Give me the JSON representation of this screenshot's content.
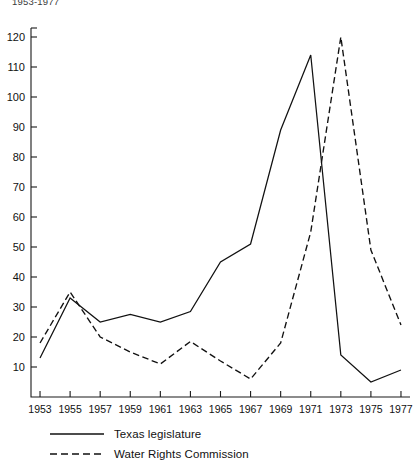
{
  "figure": {
    "top_note": "1953-1977"
  },
  "chart_data": {
    "type": "line",
    "title": "",
    "subtitle": "",
    "xlabel": "",
    "ylabel": "",
    "x": [
      1953,
      1954,
      1955,
      1956,
      1957,
      1958,
      1959,
      1960,
      1961,
      1962,
      1963,
      1964,
      1965,
      1966,
      1967,
      1968,
      1969,
      1970,
      1971,
      1972,
      1973,
      1974,
      1975,
      1976,
      1977
    ],
    "categories": [
      "1953",
      "1955",
      "1957",
      "1959",
      "1961",
      "1963",
      "1965",
      "1967",
      "1969",
      "1971",
      "1973",
      "1975",
      "1977"
    ],
    "xticks": [
      1953,
      1955,
      1957,
      1959,
      1961,
      1963,
      1965,
      1967,
      1969,
      1971,
      1973,
      1975,
      1977
    ],
    "xtick_labels": [
      "1953",
      "1955",
      "1957",
      "1959",
      "1961",
      "1963",
      "1965",
      "1967",
      "1969",
      "1971",
      "1973",
      "1975",
      "1977"
    ],
    "yticks": [
      10,
      20,
      30,
      40,
      50,
      60,
      70,
      80,
      90,
      100,
      110,
      120
    ],
    "ytick_labels": [
      "10",
      "20",
      "30",
      "40",
      "50",
      "60",
      "70",
      "80",
      "90",
      "100",
      "110",
      "120"
    ],
    "xlim": [
      1952.4,
      1977.6
    ],
    "ylim": [
      0,
      123
    ],
    "grid": false,
    "legend_position": "below-left",
    "series": [
      {
        "name": "Texas legislature",
        "style": "solid",
        "color": "#111111",
        "x": [
          1953,
          1955,
          1957,
          1959,
          1961,
          1963,
          1965,
          1967,
          1969,
          1971,
          1973,
          1975,
          1977
        ],
        "values": [
          13,
          33,
          25,
          27.5,
          25,
          28.5,
          45,
          51,
          89,
          114,
          14,
          5,
          9
        ]
      },
      {
        "name": "Water Rights Commission",
        "style": "dashed",
        "color": "#111111",
        "x": [
          1953,
          1955,
          1957,
          1959,
          1961,
          1963,
          1965,
          1967,
          1969,
          1971,
          1973,
          1975,
          1977
        ],
        "values": [
          18,
          35,
          20,
          15,
          11,
          18.5,
          12,
          6,
          18,
          55,
          120,
          49,
          24
        ]
      }
    ]
  },
  "legend": {
    "items": [
      {
        "label": "Texas legislature",
        "style": "solid"
      },
      {
        "label": "Water Rights Commission",
        "style": "dashed"
      }
    ]
  }
}
